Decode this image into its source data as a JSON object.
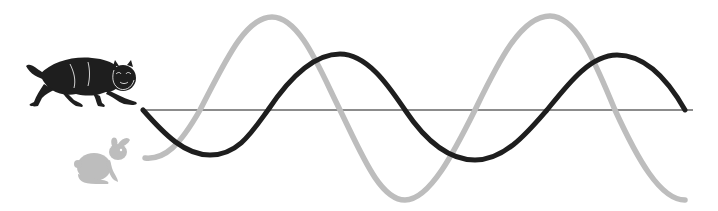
{
  "diagram": {
    "type": "predator-prey population cycles",
    "colors": {
      "predator": "#1e1e1e",
      "prey": "#bdbdbd",
      "axis": "#666666",
      "background": "#ffffff"
    },
    "legend": [
      {
        "name": "predator",
        "icon": "cat-icon",
        "color": "#1e1e1e"
      },
      {
        "name": "prey",
        "icon": "rabbit-icon",
        "color": "#bdbdbd"
      }
    ],
    "axis": {
      "x1": 142,
      "x2": 693,
      "y": 110
    },
    "series": [
      {
        "name": "predator",
        "points": [
          [
            143,
            110
          ],
          [
            210,
            155
          ],
          [
            268,
            110
          ],
          [
            340,
            54
          ],
          [
            405,
            110
          ],
          [
            475,
            160
          ],
          [
            547,
            110
          ],
          [
            617,
            55
          ],
          [
            685,
            110
          ]
        ]
      },
      {
        "name": "prey",
        "points": [
          [
            145,
            158
          ],
          [
            200,
            110
          ],
          [
            272,
            17
          ],
          [
            340,
            110
          ],
          [
            405,
            200
          ],
          [
            475,
            110
          ],
          [
            550,
            16
          ],
          [
            615,
            110
          ],
          [
            685,
            200
          ]
        ]
      }
    ]
  }
}
